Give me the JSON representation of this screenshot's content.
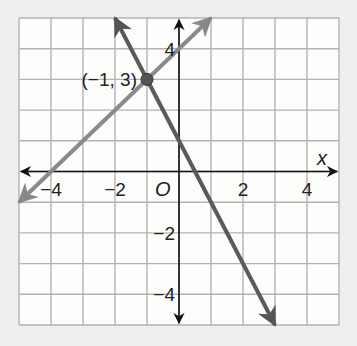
{
  "chart_data": {
    "type": "line",
    "title": "",
    "xlabel": "x",
    "ylabel": "",
    "xlim": [
      -5,
      5
    ],
    "ylim": [
      -5,
      5
    ],
    "grid": true,
    "origin_label": "O",
    "x_ticks": [
      {
        "value": -4,
        "label": "−4"
      },
      {
        "value": -2,
        "label": "−2"
      },
      {
        "value": 2,
        "label": "2"
      },
      {
        "value": 4,
        "label": "4"
      }
    ],
    "y_ticks": [
      {
        "value": 4,
        "label": "4"
      },
      {
        "value": -2,
        "label": "−2"
      },
      {
        "value": -4,
        "label": "−4"
      }
    ],
    "series": [
      {
        "name": "line-1",
        "equation": "y = x + 4",
        "color": "#8a8a8a",
        "x": [
          -5,
          1
        ],
        "y": [
          -1,
          5
        ]
      },
      {
        "name": "line-2",
        "equation": "y = -2x + 1",
        "color": "#5a5a5a",
        "x": [
          -2,
          3
        ],
        "y": [
          5,
          -5
        ]
      }
    ],
    "annotations": [
      {
        "point": [
          -1,
          3
        ],
        "label": "(−1, 3)"
      }
    ]
  }
}
